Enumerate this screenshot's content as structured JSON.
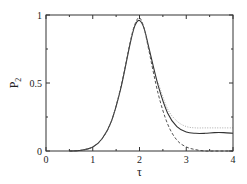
{
  "chart_data": {
    "type": "line",
    "title": "",
    "xlabel": "τ",
    "ylabel": "P",
    "ylabel_subscript": "2",
    "xlim": [
      0,
      4
    ],
    "ylim": [
      0,
      1
    ],
    "grid": false,
    "legend": null,
    "x_ticks": [
      0,
      1,
      2,
      3,
      4
    ],
    "x_tick_labels": [
      "0",
      "1",
      "2",
      "3",
      "4"
    ],
    "x_minor_ticks": [
      0.5,
      1.5,
      2.5,
      3.5
    ],
    "y_ticks": [
      0,
      0.5,
      1
    ],
    "y_tick_labels": [
      "0",
      "0.5",
      "1"
    ],
    "y_minor_ticks": [
      0.25,
      0.75
    ],
    "series": [
      {
        "name": "solid",
        "style": "solid",
        "color": "#333333",
        "x": [
          0.5,
          0.75,
          1.0,
          1.2,
          1.4,
          1.6,
          1.8,
          1.9,
          2.0,
          2.1,
          2.2,
          2.4,
          2.6,
          2.8,
          3.0,
          3.2,
          3.4,
          3.6,
          3.8,
          4.0
        ],
        "values": [
          0.0,
          0.005,
          0.03,
          0.09,
          0.22,
          0.46,
          0.79,
          0.92,
          0.96,
          0.9,
          0.76,
          0.48,
          0.28,
          0.18,
          0.14,
          0.13,
          0.13,
          0.135,
          0.135,
          0.13
        ]
      },
      {
        "name": "dashed",
        "style": "dashed",
        "color": "#555555",
        "x": [
          0.5,
          0.75,
          1.0,
          1.2,
          1.4,
          1.6,
          1.8,
          1.9,
          2.0,
          2.1,
          2.2,
          2.4,
          2.6,
          2.8,
          3.0,
          3.2,
          3.4,
          3.6,
          3.8,
          4.0
        ],
        "values": [
          0.0,
          0.005,
          0.03,
          0.09,
          0.22,
          0.47,
          0.8,
          0.93,
          0.98,
          0.9,
          0.74,
          0.42,
          0.2,
          0.08,
          0.03,
          0.01,
          0.0,
          0.0,
          0.0,
          0.0
        ]
      },
      {
        "name": "dotted",
        "style": "dotted",
        "color": "#aaaaaa",
        "x": [
          2.4,
          2.6,
          2.8,
          3.0,
          3.2,
          3.4,
          3.6,
          3.8,
          4.0
        ],
        "values": [
          0.5,
          0.31,
          0.22,
          0.18,
          0.17,
          0.17,
          0.17,
          0.17,
          0.17
        ]
      }
    ]
  },
  "plot_area": {
    "left": 46,
    "top": 15,
    "right": 233,
    "bottom": 151
  }
}
